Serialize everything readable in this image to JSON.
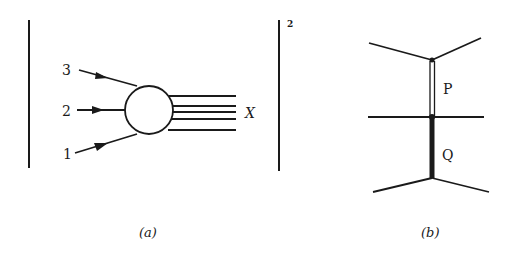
{
  "diagram_a": {
    "caption": "(a)",
    "incoming_labels": [
      "3",
      "2",
      "1"
    ],
    "outgoing_label": "X",
    "exponent": "2",
    "outgoing_lines_count": 5
  },
  "diagram_b": {
    "caption": "(b)",
    "upper_propagator_label": "P",
    "lower_propagator_label": "Q"
  },
  "colors": {
    "ink": "#1a1a1a",
    "background": "#ffffff"
  }
}
